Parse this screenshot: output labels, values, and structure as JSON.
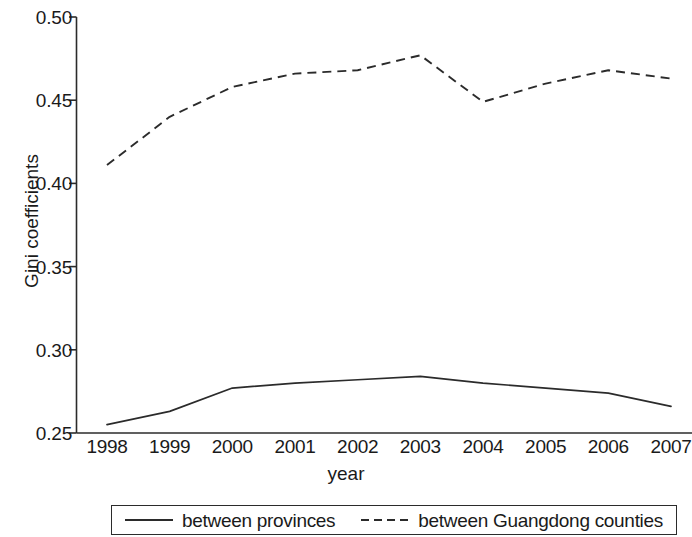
{
  "chart_data": {
    "type": "line",
    "title": "",
    "subtitle": "",
    "xlabel": "year",
    "ylabel": "Gini coefficients",
    "categories": [
      "1998",
      "1999",
      "2000",
      "2001",
      "2002",
      "2003",
      "2004",
      "2005",
      "2006",
      "2007"
    ],
    "x": [
      1998,
      1999,
      2000,
      2001,
      2002,
      2003,
      2004,
      2005,
      2006,
      2007
    ],
    "xlim": [
      1998,
      2007
    ],
    "ylim": [
      0.25,
      0.5
    ],
    "yticks": [
      "0.50",
      "0.45",
      "0.40",
      "0.35",
      "0.30",
      "0.25"
    ],
    "ytick_values": [
      0.5,
      0.45,
      0.4,
      0.35,
      0.3,
      0.25
    ],
    "grid": false,
    "legend_position": "bottom",
    "series": [
      {
        "name": "between provinces",
        "style": "solid",
        "color": "#2b2b2b",
        "values": [
          0.255,
          0.263,
          0.277,
          0.28,
          0.282,
          0.284,
          0.28,
          0.277,
          0.274,
          0.266
        ]
      },
      {
        "name": "between Guangdong counties",
        "style": "dashed",
        "color": "#2b2b2b",
        "values": [
          0.411,
          0.44,
          0.458,
          0.466,
          0.468,
          0.477,
          0.449,
          0.46,
          0.468,
          0.463
        ]
      }
    ]
  },
  "axes": {
    "y_title": "Gini coefficients",
    "x_title": "year",
    "y_tick_labels": [
      "0.50",
      "0.45",
      "0.40",
      "0.35",
      "0.30",
      "0.25"
    ],
    "x_tick_labels": [
      "1998",
      "1999",
      "2000",
      "2001",
      "2002",
      "2003",
      "2004",
      "2005",
      "2006",
      "2007"
    ]
  },
  "legend": {
    "items": [
      {
        "label": "between provinces",
        "style": "solid"
      },
      {
        "label": "between Guangdong counties",
        "style": "dashed"
      }
    ]
  }
}
